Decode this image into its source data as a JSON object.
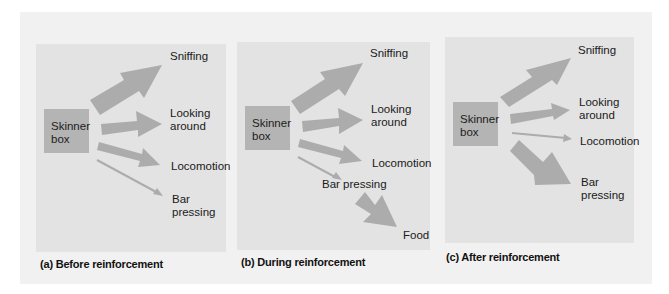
{
  "diagram": {
    "arrow_color": "#acacac",
    "box_color": "#b4b4b4",
    "panels": [
      {
        "id": "a",
        "caption": "(a) Before reinforcement",
        "source": "Skinner box",
        "source_lines": [
          "Skinner",
          "box"
        ],
        "behaviors": [
          {
            "label": "Sniffing",
            "strength": "very large"
          },
          {
            "label": "Looking\naround",
            "strength": "large"
          },
          {
            "label": "Locomotion",
            "strength": "medium"
          },
          {
            "label": "Bar\npressing",
            "strength": "thin"
          }
        ]
      },
      {
        "id": "b",
        "caption": "(b) During reinforcement",
        "source": "Skinner box",
        "source_lines": [
          "Skinner",
          "box"
        ],
        "behaviors": [
          {
            "label": "Sniffing",
            "strength": "very large"
          },
          {
            "label": "Looking\naround",
            "strength": "large"
          },
          {
            "label": "Locomotion",
            "strength": "medium"
          },
          {
            "label": "Bar pressing",
            "strength": "thin"
          }
        ],
        "consequence": {
          "from": "Bar pressing",
          "label": "Food",
          "strength": "very large"
        }
      },
      {
        "id": "c",
        "caption": "(c) After reinforcement",
        "source": "Skinner box",
        "source_lines": [
          "Skinner",
          "box"
        ],
        "behaviors": [
          {
            "label": "Sniffing",
            "strength": "large"
          },
          {
            "label": "Looking\naround",
            "strength": "medium"
          },
          {
            "label": "Locomotion",
            "strength": "thin"
          },
          {
            "label": "Bar\npressing",
            "strength": "very large"
          }
        ]
      }
    ]
  }
}
